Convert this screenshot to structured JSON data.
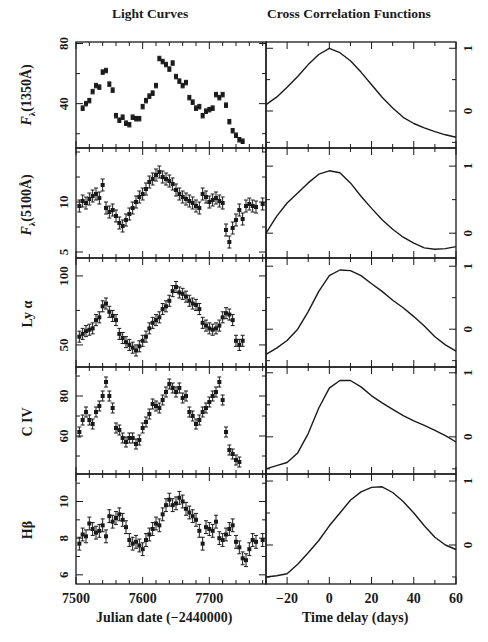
{
  "titles": {
    "left": "Light Curves",
    "right": "Cross Correlation Functions"
  },
  "xlabels": {
    "left": "Julian date (−2440000)",
    "right": "Time delay (days)"
  },
  "ylabels": [
    "Fλ(1350Å)",
    "Fλ(5100Å)",
    "Ly α",
    "C IV",
    "Hβ"
  ],
  "chart_data": [
    {
      "type": "scatter",
      "title": "Light Curves",
      "xlabel": "Julian date (−2440000)",
      "xlim": [
        7500,
        7785
      ],
      "xticks": [
        7500,
        7600,
        7700
      ],
      "panels": [
        {
          "name": "Fλ(1350Å)",
          "ylabel": "Fλ(1350Å)",
          "ylim": [
            10.5,
            81
          ],
          "yticks": [
            40,
            80
          ],
          "x": [
            7510,
            7515,
            7520,
            7525,
            7530,
            7535,
            7540,
            7545,
            7550,
            7555,
            7560,
            7565,
            7570,
            7575,
            7580,
            7585,
            7590,
            7595,
            7600,
            7605,
            7610,
            7615,
            7620,
            7625,
            7630,
            7635,
            7640,
            7645,
            7650,
            7655,
            7660,
            7665,
            7670,
            7675,
            7680,
            7685,
            7690,
            7695,
            7700,
            7705,
            7710,
            7715,
            7720,
            7725,
            7730,
            7735,
            7740,
            7745,
            7750
          ],
          "y": [
            37,
            40,
            42,
            48,
            52,
            51,
            61,
            62,
            53,
            49,
            32,
            29,
            31,
            27,
            26,
            31,
            30,
            30,
            38,
            42,
            45,
            47,
            52,
            70,
            68,
            66,
            63,
            67,
            58,
            55,
            52,
            54,
            44,
            41,
            37,
            38,
            32,
            35,
            36,
            37,
            46,
            44,
            46,
            39,
            28,
            22,
            19,
            16,
            15
          ],
          "errors": 1.5
        },
        {
          "name": "Fλ(5100Å)",
          "ylabel": "Fλ(5100Å)",
          "ylim": [
            4.4,
            15.4
          ],
          "yticks": [
            5,
            10
          ],
          "x": [
            7505,
            7510,
            7515,
            7520,
            7525,
            7530,
            7535,
            7540,
            7545,
            7550,
            7555,
            7560,
            7565,
            7570,
            7575,
            7580,
            7585,
            7590,
            7595,
            7600,
            7605,
            7610,
            7615,
            7620,
            7625,
            7630,
            7635,
            7640,
            7645,
            7650,
            7655,
            7660,
            7665,
            7670,
            7675,
            7680,
            7685,
            7690,
            7695,
            7700,
            7705,
            7710,
            7715,
            7720,
            7725,
            7730,
            7735,
            7740,
            7745,
            7750,
            7755,
            7760,
            7765,
            7770,
            7780
          ],
          "y": [
            9.6,
            10.1,
            9.9,
            10.3,
            10.6,
            10.8,
            10.4,
            11.7,
            9.4,
            9.0,
            9.2,
            8.6,
            7.9,
            7.6,
            8.2,
            8.8,
            9.4,
            10.0,
            10.5,
            10.8,
            11.3,
            12.0,
            12.3,
            12.7,
            13.0,
            12.5,
            12.3,
            12.1,
            11.8,
            11.2,
            10.8,
            10.5,
            10.3,
            10.1,
            9.9,
            9.6,
            9.4,
            10.8,
            10.5,
            10.0,
            10.2,
            10.4,
            10.1,
            9.9,
            7.2,
            6.0,
            7.4,
            8.2,
            9.2,
            8.3,
            9.6,
            9.8,
            9.6,
            9.5,
            9.8
          ],
          "errors": 0.6
        },
        {
          "name": "Ly α",
          "ylabel": "Ly α",
          "ylim": [
            34,
            113
          ],
          "yticks": [
            50,
            100
          ],
          "x": [
            7505,
            7510,
            7515,
            7520,
            7525,
            7530,
            7535,
            7540,
            7545,
            7550,
            7555,
            7560,
            7565,
            7570,
            7575,
            7580,
            7585,
            7590,
            7595,
            7600,
            7605,
            7610,
            7615,
            7620,
            7625,
            7630,
            7635,
            7640,
            7645,
            7650,
            7655,
            7660,
            7665,
            7670,
            7675,
            7680,
            7685,
            7690,
            7695,
            7700,
            7705,
            7710,
            7715,
            7720,
            7725,
            7730,
            7735,
            7740,
            7745,
            7750
          ],
          "y": [
            56,
            58,
            60,
            61,
            62,
            68,
            70,
            78,
            80,
            74,
            71,
            68,
            58,
            55,
            52,
            50,
            48,
            46,
            49,
            53,
            56,
            62,
            66,
            68,
            70,
            76,
            78,
            82,
            89,
            92,
            88,
            87,
            85,
            82,
            80,
            79,
            76,
            66,
            64,
            62,
            61,
            62,
            64,
            70,
            73,
            72,
            68,
            53,
            50,
            53
          ],
          "errors": 4
        },
        {
          "name": "C IV",
          "ylabel": "C IV",
          "ylim": [
            41,
            94.5
          ],
          "yticks": [
            60,
            80
          ],
          "x": [
            7505,
            7510,
            7515,
            7520,
            7525,
            7530,
            7535,
            7540,
            7545,
            7550,
            7555,
            7560,
            7565,
            7570,
            7575,
            7580,
            7585,
            7590,
            7595,
            7600,
            7605,
            7610,
            7615,
            7620,
            7625,
            7630,
            7635,
            7640,
            7645,
            7650,
            7655,
            7660,
            7665,
            7670,
            7675,
            7680,
            7685,
            7690,
            7695,
            7700,
            7705,
            7710,
            7715,
            7720,
            7725,
            7730,
            7735,
            7740,
            7745
          ],
          "y": [
            62,
            68,
            72,
            68,
            66,
            72,
            75,
            80,
            87,
            80,
            74,
            64,
            63,
            59,
            57,
            59,
            59,
            56,
            58,
            64,
            67,
            71,
            76,
            75,
            74,
            78,
            82,
            86,
            84,
            82,
            84,
            79,
            80,
            72,
            70,
            66,
            68,
            72,
            74,
            77,
            80,
            82,
            87,
            78,
            62,
            53,
            51,
            48,
            47
          ],
          "errors": 2.5
        },
        {
          "name": "Hβ",
          "ylabel": "Hβ",
          "ylim": [
            5.5,
            11.5
          ],
          "yticks": [
            6,
            8,
            10
          ],
          "x": [
            7505,
            7510,
            7515,
            7520,
            7525,
            7530,
            7535,
            7540,
            7545,
            7550,
            7555,
            7560,
            7565,
            7570,
            7575,
            7580,
            7585,
            7590,
            7595,
            7600,
            7605,
            7610,
            7615,
            7620,
            7625,
            7630,
            7635,
            7640,
            7645,
            7650,
            7655,
            7660,
            7665,
            7670,
            7675,
            7680,
            7685,
            7690,
            7695,
            7700,
            7705,
            7710,
            7715,
            7720,
            7725,
            7730,
            7735,
            7740,
            7745,
            7750,
            7755,
            7760,
            7765,
            7770,
            7780
          ],
          "y": [
            7.7,
            8.2,
            8.1,
            8.8,
            8.5,
            8.3,
            8.4,
            8.7,
            8.1,
            9.2,
            8.9,
            9.1,
            9.3,
            9.0,
            8.6,
            7.9,
            7.7,
            7.8,
            7.6,
            7.4,
            7.9,
            8.2,
            8.5,
            8.8,
            8.7,
            9.3,
            9.8,
            10.1,
            9.8,
            9.9,
            10.2,
            10.0,
            9.6,
            9.4,
            9.2,
            9.0,
            8.4,
            7.7,
            8.6,
            8.5,
            8.4,
            8.9,
            8.0,
            7.9,
            8.2,
            8.5,
            8.7,
            7.8,
            7.5,
            6.9,
            6.8,
            7.4,
            7.9,
            7.8,
            7.9
          ],
          "errors": 0.35
        }
      ]
    },
    {
      "type": "line",
      "title": "Cross Correlation Functions",
      "xlabel": "Time delay (days)",
      "xlim": [
        -30,
        60
      ],
      "xticks": [
        -20,
        0,
        20,
        40,
        60
      ],
      "yaxis_side": "right",
      "panels": [
        {
          "name": "CCF Fλ(1350Å)",
          "yticks": [
            0,
            1
          ],
          "ylim": [
            -0.59,
            1.1
          ],
          "peak_lag": 0,
          "x": [
            -30,
            -28,
            -25,
            -20,
            -15,
            -10,
            -5,
            0,
            5,
            10,
            15,
            20,
            25,
            30,
            35,
            40,
            45,
            50,
            55,
            60
          ],
          "y": [
            0.1,
            0.15,
            0.22,
            0.38,
            0.55,
            0.74,
            0.9,
            1.0,
            0.93,
            0.8,
            0.62,
            0.42,
            0.22,
            0.05,
            -0.1,
            -0.2,
            -0.27,
            -0.33,
            -0.38,
            -0.42
          ]
        },
        {
          "name": "CCF Fλ(5100Å)",
          "yticks": [
            0,
            1
          ],
          "ylim": [
            -0.37,
            1.27
          ],
          "peak_lag": 3,
          "x": [
            -30,
            -25,
            -20,
            -15,
            -10,
            -5,
            0,
            5,
            10,
            15,
            20,
            25,
            30,
            35,
            40,
            45,
            50,
            55,
            60
          ],
          "y": [
            0.0,
            0.25,
            0.45,
            0.6,
            0.75,
            0.88,
            0.93,
            0.9,
            0.75,
            0.55,
            0.37,
            0.2,
            0.06,
            -0.06,
            -0.15,
            -0.22,
            -0.24,
            -0.23,
            -0.2
          ]
        },
        {
          "name": "CCF Ly α",
          "yticks": [
            0,
            1
          ],
          "ylim": [
            -0.6,
            1.13
          ],
          "peak_lag": 8,
          "x": [
            -30,
            -25,
            -20,
            -15,
            -10,
            -5,
            0,
            5,
            10,
            15,
            20,
            25,
            30,
            35,
            40,
            45,
            50,
            55,
            60
          ],
          "y": [
            -0.4,
            -0.3,
            -0.18,
            0.0,
            0.28,
            0.6,
            0.85,
            0.94,
            0.93,
            0.85,
            0.72,
            0.6,
            0.46,
            0.34,
            0.2,
            0.05,
            -0.12,
            -0.25,
            -0.35
          ]
        },
        {
          "name": "CCF C IV",
          "yticks": [
            0,
            1
          ],
          "ylim": [
            -0.58,
            1.09
          ],
          "peak_lag": 8,
          "x": [
            -30,
            -25,
            -20,
            -15,
            -10,
            -5,
            0,
            5,
            10,
            15,
            20,
            25,
            30,
            35,
            40,
            45,
            50,
            55,
            60
          ],
          "y": [
            -0.5,
            -0.45,
            -0.4,
            -0.25,
            0.05,
            0.45,
            0.76,
            0.88,
            0.88,
            0.78,
            0.64,
            0.53,
            0.43,
            0.33,
            0.25,
            0.18,
            0.1,
            0.02,
            -0.08
          ]
        },
        {
          "name": "CCF Hβ",
          "yticks": [
            0,
            1
          ],
          "ylim": [
            -0.61,
            1.11
          ],
          "peak_lag": 22,
          "x": [
            -30,
            -25,
            -20,
            -15,
            -10,
            -5,
            0,
            5,
            10,
            15,
            20,
            25,
            30,
            35,
            40,
            45,
            50,
            55,
            60
          ],
          "y": [
            -0.5,
            -0.48,
            -0.45,
            -0.3,
            -0.12,
            0.07,
            0.3,
            0.5,
            0.7,
            0.83,
            0.9,
            0.91,
            0.82,
            0.68,
            0.5,
            0.3,
            0.12,
            0.0,
            -0.07
          ]
        }
      ]
    }
  ]
}
